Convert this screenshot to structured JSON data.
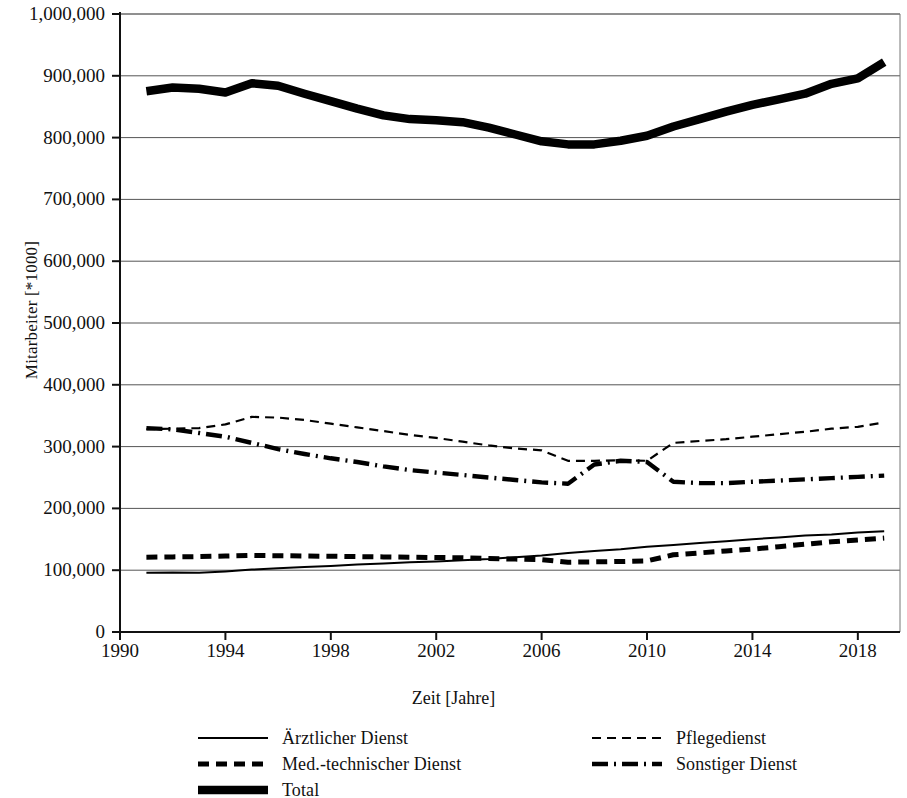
{
  "chart_data": {
    "type": "line",
    "title": "",
    "xlabel": "Zeit [Jahre]",
    "ylabel": "Mitarbeiter [*1000]",
    "xlim": [
      1990,
      2019.6
    ],
    "ylim": [
      0,
      1000000
    ],
    "xticks": [
      "1990",
      "1994",
      "1998",
      "2002",
      "2006",
      "2010",
      "2014",
      "2018"
    ],
    "xtick_values": [
      1990,
      1994,
      1998,
      2002,
      2006,
      2010,
      2014,
      2018
    ],
    "yticks": [
      "0",
      "100,000",
      "200,000",
      "300,000",
      "400,000",
      "500,000",
      "600,000",
      "700,000",
      "800,000",
      "900,000",
      "1,000,000"
    ],
    "ytick_values": [
      0,
      100000,
      200000,
      300000,
      400000,
      500000,
      600000,
      700000,
      800000,
      900000,
      1000000
    ],
    "grid": "horizontal",
    "legend_position": "bottom",
    "x": [
      1991,
      1992,
      1993,
      1994,
      1995,
      1996,
      1997,
      1998,
      1999,
      2000,
      2001,
      2002,
      2003,
      2004,
      2005,
      2006,
      2007,
      2008,
      2009,
      2010,
      2011,
      2012,
      2013,
      2014,
      2015,
      2016,
      2017,
      2018,
      2019
    ],
    "series": [
      {
        "name": "Ärztlicher Dienst",
        "style": "solid-thin",
        "color": "#000000",
        "values": [
          96000,
          96500,
          96000,
          98000,
          101000,
          103000,
          105000,
          107000,
          109000,
          111000,
          113000,
          114000,
          116000,
          118000,
          121000,
          124000,
          128000,
          131000,
          134000,
          138000,
          141000,
          144000,
          147000,
          150000,
          153000,
          156000,
          158000,
          161000,
          163000
        ]
      },
      {
        "name": "Pflegedienst",
        "style": "dashed-thin",
        "color": "#000000",
        "values": [
          328000,
          329000,
          330000,
          336000,
          348000,
          347000,
          343000,
          337000,
          331000,
          325000,
          319000,
          314000,
          308000,
          302000,
          297000,
          294000,
          277000,
          277000,
          278000,
          277000,
          306000,
          309000,
          312000,
          316000,
          320000,
          324000,
          329000,
          332000,
          339000
        ]
      },
      {
        "name": "Med.-technischer Dienst",
        "style": "dashed-thick",
        "color": "#000000",
        "values": [
          121000,
          121500,
          122000,
          123000,
          124000,
          123500,
          123000,
          122500,
          122000,
          121500,
          121000,
          120500,
          120000,
          119000,
          118000,
          117000,
          113000,
          113500,
          114000,
          115000,
          125000,
          128000,
          131000,
          134000,
          138000,
          142000,
          146000,
          149000,
          152000
        ]
      },
      {
        "name": "Sonstiger Dienst",
        "style": "dashdot",
        "color": "#000000",
        "values": [
          330000,
          328000,
          322000,
          316000,
          306000,
          296000,
          288000,
          281000,
          275000,
          268000,
          262000,
          258000,
          254000,
          250000,
          246000,
          242000,
          240000,
          271000,
          277000,
          275000,
          243000,
          241000,
          241000,
          243000,
          245000,
          247000,
          249000,
          251000,
          253000
        ]
      },
      {
        "name": "Total",
        "style": "solid-verythick",
        "color": "#000000",
        "values": [
          875000,
          881000,
          879000,
          873000,
          888000,
          884000,
          871000,
          859000,
          847000,
          836000,
          830000,
          828000,
          825000,
          816000,
          805000,
          794000,
          789000,
          789000,
          795000,
          803000,
          818000,
          830000,
          842000,
          853000,
          862000,
          871000,
          887000,
          896000,
          922000
        ]
      }
    ]
  },
  "legend": {
    "items": [
      {
        "label": "Ärztlicher Dienst",
        "style": "solid-thin"
      },
      {
        "label": "Med.-technischer Dienst",
        "style": "dashed-thick"
      },
      {
        "label": "Total",
        "style": "solid-verythick"
      },
      {
        "label": "Pflegedienst",
        "style": "dashed-thin"
      },
      {
        "label": "Sonstiger Dienst",
        "style": "dashdot"
      }
    ]
  }
}
